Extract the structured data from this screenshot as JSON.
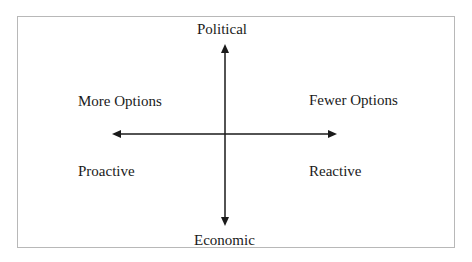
{
  "diagram": {
    "axes": {
      "vertical": {
        "top": "Political",
        "bottom": "Economic"
      },
      "horizontal": {
        "left_upper": "More Options",
        "right_upper": "Fewer Options",
        "left_lower": "Proactive",
        "right_lower": "Reactive"
      }
    },
    "colors": {
      "line": "#1a1a1a",
      "frame": "#b8b8b8",
      "background": "#ffffff"
    }
  }
}
